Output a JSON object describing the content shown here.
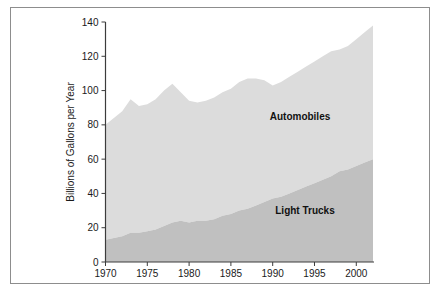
{
  "figure": {
    "border_color": "#8d8d8d",
    "background": "#ffffff"
  },
  "axes": {
    "y_axis_title": "Billions of Gallons per Year",
    "y_ticks": [
      "0",
      "20",
      "40",
      "60",
      "80",
      "100",
      "120",
      "140"
    ],
    "x_ticks": [
      "1970",
      "1975",
      "1980",
      "1985",
      "1990",
      "1995",
      "2000"
    ]
  },
  "labels": {
    "automobiles": "Automobiles",
    "light_trucks": "Light Trucks"
  },
  "colors": {
    "automobiles_fill": "#dcdcdc",
    "light_trucks_fill": "#c0c0c0",
    "axis": "#3c3c3c",
    "text": "#1a1a1a"
  },
  "chart_data": {
    "type": "area",
    "title": "",
    "xlabel": "",
    "ylabel": "Billions of Gallons per Year",
    "xlim": [
      1970,
      2002
    ],
    "ylim": [
      0,
      140
    ],
    "grid": false,
    "legend": "inline-labels",
    "stacked": true,
    "x": [
      1970,
      1971,
      1972,
      1973,
      1974,
      1975,
      1976,
      1977,
      1978,
      1979,
      1980,
      1981,
      1982,
      1983,
      1984,
      1985,
      1986,
      1987,
      1988,
      1989,
      1990,
      1991,
      1992,
      1993,
      1994,
      1995,
      1996,
      1997,
      1998,
      1999,
      2000,
      2001,
      2002
    ],
    "series": [
      {
        "name": "Light Trucks",
        "values": [
          13,
          14,
          15,
          17,
          17,
          18,
          19,
          21,
          23,
          24,
          23,
          24,
          24,
          25,
          27,
          28,
          30,
          31,
          33,
          35,
          37,
          38,
          40,
          42,
          44,
          46,
          48,
          50,
          53,
          54,
          56,
          58,
          60
        ]
      },
      {
        "name": "Automobiles",
        "values": [
          67,
          70,
          73,
          78,
          74,
          74,
          76,
          79,
          81,
          75,
          71,
          69,
          70,
          71,
          72,
          73,
          75,
          76,
          74,
          71,
          66,
          67,
          68,
          69,
          70,
          71,
          72,
          73,
          71,
          72,
          74,
          76,
          78
        ]
      }
    ],
    "totals": [
      80,
      84,
      88,
      95,
      91,
      92,
      95,
      100,
      104,
      99,
      94,
      93,
      94,
      96,
      99,
      101,
      105,
      107,
      107,
      106,
      103,
      105,
      108,
      111,
      114,
      117,
      120,
      123,
      124,
      126,
      130,
      134,
      138
    ]
  }
}
